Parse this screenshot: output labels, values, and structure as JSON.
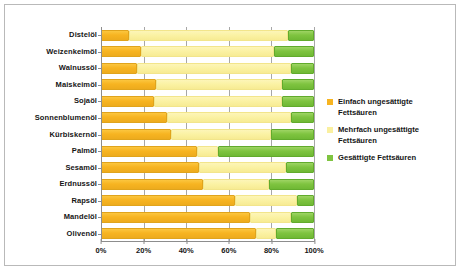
{
  "chart_data": {
    "type": "bar",
    "orientation": "horizontal",
    "stacked": true,
    "normalized": true,
    "title": "",
    "xlabel": "",
    "ylabel": "",
    "xlim": [
      0,
      100
    ],
    "xticks": [
      0,
      20,
      40,
      60,
      80,
      100
    ],
    "xticklabels": [
      "0%",
      "20%",
      "40%",
      "60%",
      "80%",
      "100%"
    ],
    "grid": true,
    "legend_position": "right",
    "categories": [
      "Distelöl",
      "Weizenkeimöl",
      "Walnussöl",
      "Maiskeimöl",
      "Sojaöl",
      "Sonnenblumenöl",
      "Kürbiskernöl",
      "Palmöl",
      "Sesamöl",
      "Erdnussöl",
      "Rapsöl",
      "Mandelöl",
      "Olivenöl"
    ],
    "series": [
      {
        "name": "Einfach ungesättigte Fettsäuren",
        "color": "#f7b421",
        "values": [
          13,
          19,
          17,
          26,
          25,
          31,
          33,
          45,
          46,
          48,
          63,
          70,
          73
        ]
      },
      {
        "name": "Mehrfach ungesättigte Fettsäuren",
        "color": "#faf0a0",
        "values": [
          75,
          62,
          72,
          59,
          60,
          58,
          47,
          10,
          41,
          31,
          29,
          19,
          9
        ]
      },
      {
        "name": "Gesättigte Fettsäuren",
        "color": "#7fc440",
        "values": [
          12,
          19,
          11,
          15,
          15,
          11,
          20,
          45,
          13,
          21,
          8,
          11,
          18
        ]
      }
    ]
  },
  "legend": {
    "items": [
      {
        "label": "Einfach ungesättigte Fettsäuren",
        "swatch": "sw-mono"
      },
      {
        "label": "Mehrfach ungesättigte Fettsäuren",
        "swatch": "sw-poly"
      },
      {
        "label": "Gesättigte Fettsäuren",
        "swatch": "sw-sat"
      }
    ]
  }
}
